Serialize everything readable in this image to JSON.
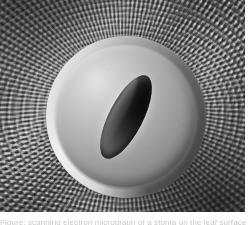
{
  "figure": {
    "kind": "scanning-electron-micrograph",
    "palette": {
      "background": "#ffffff",
      "cuticle_mid": "#8e8e8e",
      "cuticle_dark": "#3a3a3a",
      "cuticle_light": "#d8d8d8",
      "dome_highlight": "#e3e3e3",
      "dome_mid": "#b6b6b6",
      "dome_shadow": "#5d5d5d",
      "pore_dark": "#0b0b0b"
    },
    "plate": {
      "width_px": 245,
      "height_px": 212
    },
    "structures": {
      "stomatal_complex": "stomatal complex",
      "guard_cell_dome": "guard cell dome",
      "stomatal_pore": "stomatal pore",
      "cuticular_striations": "cuticular striations"
    }
  },
  "caption": {
    "text": "Figure: scanning electron micrograph of a stoma on the leaf surface"
  }
}
